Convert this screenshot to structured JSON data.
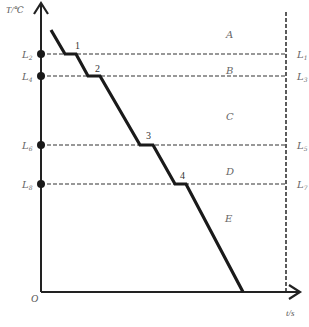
{
  "diagram": {
    "type": "cooling-curve",
    "axes": {
      "y_label": "T/℃",
      "x_label": "t/s",
      "origin_label": "O"
    },
    "left_levels": [
      {
        "label": "L",
        "sub": "2",
        "y": 54
      },
      {
        "label": "L",
        "sub": "4",
        "y": 76
      },
      {
        "label": "L",
        "sub": "6",
        "y": 145
      },
      {
        "label": "L",
        "sub": "8",
        "y": 184
      }
    ],
    "right_levels": [
      {
        "label": "L",
        "sub": "1",
        "y": 54
      },
      {
        "label": "L",
        "sub": "3",
        "y": 76
      },
      {
        "label": "L",
        "sub": "5",
        "y": 145
      },
      {
        "label": "L",
        "sub": "7",
        "y": 184
      }
    ],
    "regions": [
      {
        "label": "A"
      },
      {
        "label": "B"
      },
      {
        "label": "C"
      },
      {
        "label": "D"
      },
      {
        "label": "E"
      }
    ],
    "plateaus": [
      {
        "label": "1"
      },
      {
        "label": "2"
      },
      {
        "label": "3"
      },
      {
        "label": "4"
      }
    ],
    "colors": {
      "line": "#1a1a1a",
      "dashed": "#333333",
      "text": "#666666"
    }
  }
}
